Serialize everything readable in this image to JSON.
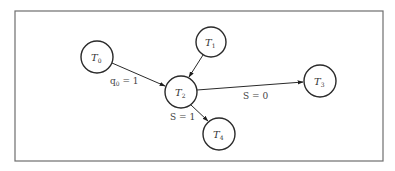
{
  "diagram": {
    "type": "directed-graph",
    "frame": {
      "x": 15,
      "y": 11,
      "width": 368,
      "height": 150,
      "stroke": "#6e6e6e"
    },
    "nodes": [
      {
        "id": "T0",
        "base": "T",
        "sub": "0",
        "cx": 97,
        "cy": 57,
        "r": 16
      },
      {
        "id": "T1",
        "base": "T",
        "sub": "1",
        "cx": 211,
        "cy": 42,
        "r": 15
      },
      {
        "id": "T2",
        "base": "T",
        "sub": "2",
        "cx": 181,
        "cy": 92,
        "r": 16
      },
      {
        "id": "T3",
        "base": "T",
        "sub": "3",
        "cx": 320,
        "cy": 81,
        "r": 16
      },
      {
        "id": "T4",
        "base": "T",
        "sub": "4",
        "cx": 219,
        "cy": 134,
        "r": 16
      }
    ],
    "edges": [
      {
        "from": "T0",
        "to": "T2",
        "label": {
          "base": "q",
          "sub": "0",
          "rest": " = 1"
        }
      },
      {
        "from": "T1",
        "to": "T2",
        "label": null
      },
      {
        "from": "T2",
        "to": "T3",
        "label": {
          "base": "S",
          "sub": "",
          "rest": " = 0"
        }
      },
      {
        "from": "T2",
        "to": "T4",
        "label": {
          "base": "S",
          "sub": "",
          "rest": " = 1"
        }
      }
    ],
    "labels": {
      "q0": {
        "base": "q",
        "sub": "0",
        "rest": " = 1",
        "x": 110,
        "y": 84
      },
      "s0": {
        "text": "S = 0",
        "x": 243,
        "y": 99
      },
      "s1": {
        "text": "S = 1",
        "x": 170,
        "y": 120
      }
    },
    "colors": {
      "stroke": "#2a2a2a",
      "text": "#333333",
      "background": "#ffffff"
    }
  }
}
